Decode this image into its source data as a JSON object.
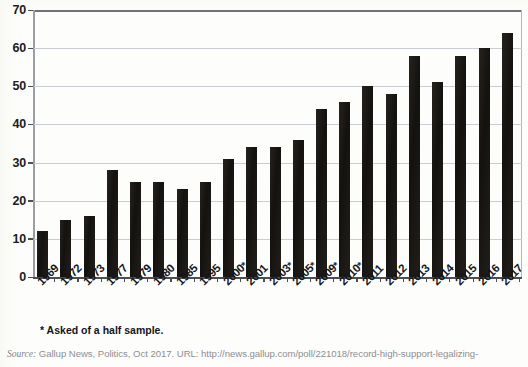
{
  "chart_data": {
    "type": "bar",
    "title": "",
    "subtitle": "",
    "xlabel": "",
    "ylabel": "",
    "ylim": [
      0,
      70
    ],
    "ytick_step": 10,
    "grid": true,
    "legend": false,
    "bar_color": "#1a1815",
    "categories": [
      "1969",
      "1972",
      "1973",
      "1977",
      "1979",
      "1980",
      "1985",
      "1995",
      "2000*",
      "2001",
      "2003*",
      "2005*",
      "2009*",
      "2010*",
      "2011",
      "2012",
      "2013",
      "2014",
      "2015",
      "2016",
      "2017"
    ],
    "values": [
      12,
      15,
      16,
      28,
      25,
      25,
      23,
      25,
      31,
      34,
      34,
      36,
      44,
      46,
      50,
      48,
      58,
      51,
      58,
      60,
      64
    ],
    "ytick_labels": [
      "70",
      "60",
      "50",
      "40",
      "30",
      "20",
      "10",
      "0"
    ],
    "ytick_values": [
      70,
      60,
      50,
      40,
      30,
      20,
      10,
      0
    ]
  },
  "footnote": "* Asked of a half sample.",
  "source": {
    "label": "Source:",
    "text": " Gallup News, Politics, Oct 2017. URL: http://news.gallup.com/poll/221018/record-high-support-legalizing-"
  }
}
